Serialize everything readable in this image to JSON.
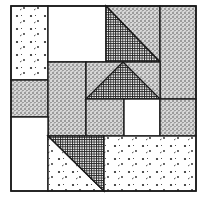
{
  "diagram": {
    "type": "quilt-block",
    "colors": {
      "line": "#1a1a1a",
      "background": "#ffffff",
      "white_patch": "#ffffff"
    },
    "fabrics": [
      "speckled-dots",
      "dense-stipple",
      "grid-check",
      "plain-white"
    ],
    "patches": [
      {
        "id": "top-left-dots",
        "fabric": "speckled-dots"
      },
      {
        "id": "top-white",
        "fabric": "plain-white"
      },
      {
        "id": "top-checked-triangle",
        "fabric": "grid-check"
      },
      {
        "id": "top-stipple-triangle",
        "fabric": "dense-stipple"
      },
      {
        "id": "right-stipple-column",
        "fabric": "dense-stipple"
      },
      {
        "id": "left-stipple-square",
        "fabric": "dense-stipple"
      },
      {
        "id": "center-left-stipple",
        "fabric": "dense-stipple"
      },
      {
        "id": "flying-goose-center",
        "fabric": "grid-check"
      },
      {
        "id": "flying-goose-sides",
        "fabric": "dense-stipple"
      },
      {
        "id": "center-stipple-square",
        "fabric": "dense-stipple"
      },
      {
        "id": "center-white-square",
        "fabric": "plain-white"
      },
      {
        "id": "right-stipple-square",
        "fabric": "dense-stipple"
      },
      {
        "id": "bottom-left-white",
        "fabric": "plain-white"
      },
      {
        "id": "bottom-checked-triangle",
        "fabric": "grid-check"
      },
      {
        "id": "bottom-dots-triangle",
        "fabric": "speckled-dots"
      },
      {
        "id": "bottom-right-dots",
        "fabric": "speckled-dots"
      }
    ]
  }
}
